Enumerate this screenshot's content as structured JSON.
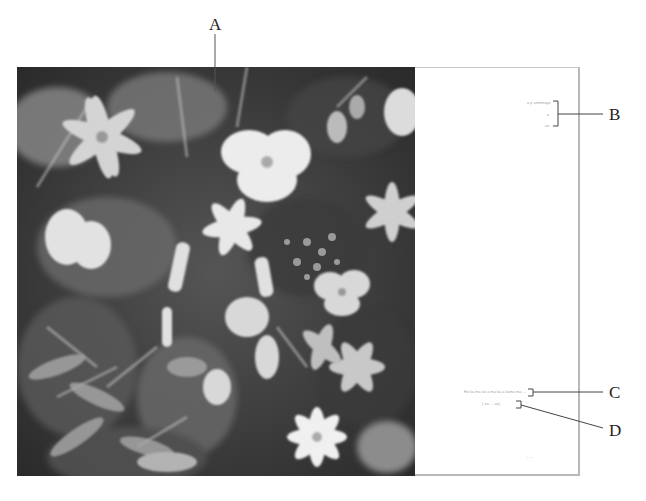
{
  "figure": {
    "callouts": [
      {
        "id": "A",
        "label": "A",
        "target": "photograph (top edge)"
      },
      {
        "id": "B",
        "label": "B",
        "target": "bracketed text group (upper right of right page)"
      },
      {
        "id": "C",
        "label": "C",
        "target": "caption line 1 (lower right page)"
      },
      {
        "id": "D",
        "label": "D",
        "target": "caption line 2 (lower right page)"
      }
    ]
  },
  "right_page": {
    "group_b": {
      "line1": "a p  amemage",
      "line2": "a",
      "line3": "an"
    },
    "caption_c": "Ho ka ma  an a  ma ka a kama ma ...",
    "caption_d": "( aa ... aa)",
    "folio": "-- --"
  },
  "photo": {
    "subject": "dense arrangement of flowers and foliage, grayscale"
  }
}
